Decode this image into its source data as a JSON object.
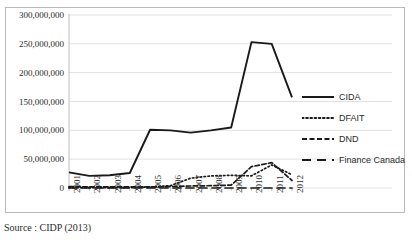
{
  "figure": {
    "title_partial": "",
    "source_caption": "Source : CIDP (2013)"
  },
  "legend": {
    "position": "right",
    "items": [
      {
        "label": "CIDA",
        "style": "solid",
        "name": "legend-item-cida"
      },
      {
        "label": "DFAIT",
        "style": "dotted",
        "name": "legend-item-dfait"
      },
      {
        "label": "DND",
        "style": "dashed",
        "name": "legend-item-dnd"
      },
      {
        "label": "Finance Canada",
        "style": "long-dash",
        "name": "legend-item-finance-canada"
      }
    ]
  },
  "axes": {
    "y_ticks": [
      "300,000,000",
      "250,000,000",
      "200,000,000",
      "150,000,000",
      "100,000,000",
      "50,000,000",
      "0"
    ],
    "x_ticks": [
      "2001",
      "2002",
      "2003",
      "2004",
      "2005",
      "2006",
      "2007",
      "2008",
      "2009",
      "2010",
      "2011",
      "2012"
    ]
  },
  "chart_data": {
    "type": "line",
    "title": "",
    "xlabel": "",
    "ylabel": "",
    "ylim": [
      0,
      300000000
    ],
    "grid": true,
    "legend_position": "right",
    "categories": [
      "2001",
      "2002",
      "2003",
      "2004",
      "2005",
      "2006",
      "2007",
      "2008",
      "2009",
      "2010",
      "2011",
      "2012"
    ],
    "ytick_values": [
      0,
      50000000,
      100000000,
      150000000,
      200000000,
      250000000,
      300000000
    ],
    "series": [
      {
        "name": "CIDA",
        "style": "solid",
        "color": "#1a1a1a",
        "values": [
          27000000,
          21000000,
          22000000,
          26000000,
          101000000,
          100000000,
          96000000,
          100000000,
          105000000,
          253000000,
          250000000,
          157000000
        ]
      },
      {
        "name": "DFAIT",
        "style": "dotted",
        "color": "#1a1a1a",
        "values": [
          500000,
          500000,
          500000,
          700000,
          1500000,
          4000000,
          17000000,
          21000000,
          22000000,
          21000000,
          40000000,
          23000000
        ]
      },
      {
        "name": "DND",
        "style": "dashed",
        "color": "#1a1a1a",
        "values": [
          2500000,
          2000000,
          2000000,
          2000000,
          2000000,
          2500000,
          3500000,
          4000000,
          5000000,
          37000000,
          44000000,
          13000000
        ]
      },
      {
        "name": "Finance Canada",
        "style": "long-dash",
        "color": "#1a1a1a",
        "values": [
          0,
          0,
          0,
          0,
          0,
          0,
          0,
          0,
          0,
          0,
          0,
          0
        ]
      }
    ]
  }
}
